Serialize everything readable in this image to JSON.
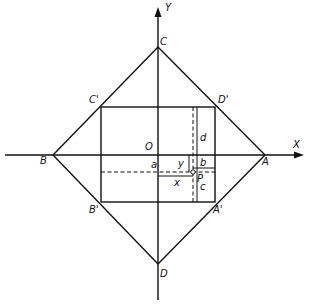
{
  "diagram": {
    "title": "",
    "axes": {
      "x_label": "X",
      "y_label": "Y",
      "origin_label": "O"
    },
    "outer_square": {
      "vertices": {
        "A": "A",
        "B": "B",
        "C": "C",
        "D": "D"
      }
    },
    "inner_rectangle": {
      "vertices": {
        "A_prime": "A'",
        "B_prime": "B'",
        "C_prime": "C'",
        "D_prime": "D'"
      }
    },
    "point": {
      "label": "P"
    },
    "distances": {
      "a": "a",
      "b": "b",
      "c": "c",
      "d": "d",
      "x": "x",
      "y": "y"
    },
    "colors": {
      "stroke": "#111111",
      "background": "#ffffff"
    }
  }
}
